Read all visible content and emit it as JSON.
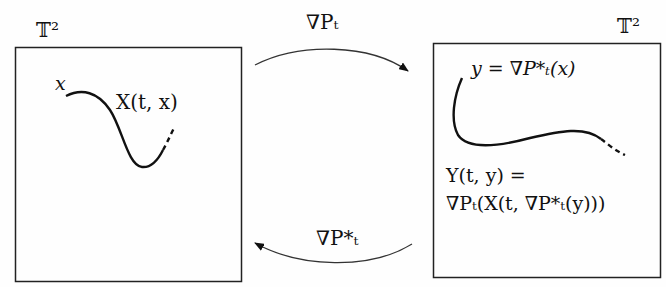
{
  "diagram": {
    "left_panel": {
      "space_label": "𝕋²",
      "start_label": "x",
      "curve_label": "X(t, x)"
    },
    "right_panel": {
      "space_label": "𝕋²",
      "start_label": "y = ∇P*ₜ(x)",
      "curve_label_line1": "Y(t, y) =",
      "curve_label_line2": "∇Pₜ(X(t, ∇P*ₜ(y)))"
    },
    "top_arrow": {
      "label": "∇Pₜ",
      "direction": "left-to-right"
    },
    "bottom_arrow": {
      "label": "∇P*ₜ",
      "direction": "right-to-left"
    }
  }
}
